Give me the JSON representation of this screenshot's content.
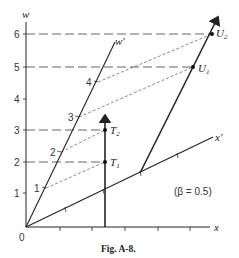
{
  "figure": {
    "caption": "Fig. A-8.",
    "annotation": "(β = 0.5)"
  },
  "axes": {
    "x_label": "x",
    "w_label": "w",
    "x_prime_label": "x′",
    "w_prime_label": "w′",
    "origin_label": "0",
    "w_ticks": [
      "1",
      "2",
      "3",
      "4",
      "5",
      "6"
    ],
    "w_prime_ticks": [
      "1",
      "2",
      "3",
      "4"
    ]
  },
  "points": {
    "T1": "T",
    "T1_sub": "1",
    "T2": "T",
    "T2_sub": "2",
    "U1": "U",
    "U1_sub": "1",
    "U2": "U",
    "U2_sub": "2"
  },
  "colors": {
    "line": "#222222",
    "dashed": "#444444"
  }
}
